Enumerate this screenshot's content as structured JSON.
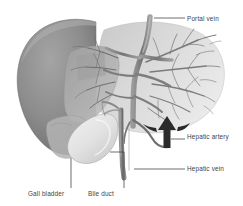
{
  "figure": {
    "background_color": "#ffffff",
    "line_color": "#3f3f3f",
    "label_color": "#3f3f3f",
    "left_lobe_color": "#8a8a8a",
    "right_lobe_color": "#d8d8d8",
    "gall_bladder_color": "#e3e3e3",
    "vessel_color": "#6f6f6f",
    "arrow_color": "#2b2b2b"
  },
  "labels": {
    "portal_vein": "Portal vein",
    "hepatic_artery": "Hepatic artery",
    "hepatic_vein": "Hepatic vein",
    "gall_bladder": "Gall bladder",
    "bile_duct": "Bile duct"
  }
}
